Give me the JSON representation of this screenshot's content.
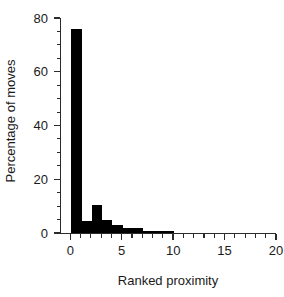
{
  "chart_data": {
    "type": "bar",
    "title": "",
    "subtitle": "",
    "xlabel": "Ranked proximity",
    "ylabel": "Percentage of moves",
    "xlim": [
      -1,
      20
    ],
    "ylim": [
      0,
      80
    ],
    "grid": false,
    "legend": null,
    "bar_color": "#000000",
    "axis_color": "#2b2b2b",
    "bin_width": 1,
    "xticks": [
      0,
      5,
      10,
      15,
      20
    ],
    "xticklabels": [
      "0",
      "5",
      "10",
      "15",
      "20"
    ],
    "xminorticks": [
      1,
      2,
      3,
      4,
      6,
      7,
      8,
      9,
      11,
      12,
      13,
      14,
      16,
      17,
      18,
      19
    ],
    "yticks": [
      0,
      20,
      40,
      60,
      80
    ],
    "yticklabels": [
      "0",
      "20",
      "40",
      "60",
      "80"
    ],
    "yminorticks": [
      5,
      10,
      15,
      25,
      30,
      35,
      45,
      50,
      55,
      65,
      70,
      75
    ],
    "categories": [
      "0",
      "1",
      "2",
      "3",
      "4",
      "5",
      "6",
      "7",
      "8",
      "9",
      "10",
      "11",
      "12",
      "13",
      "14",
      "15",
      "16",
      "17",
      "18",
      "19"
    ],
    "values": [
      76,
      4.5,
      10.5,
      5,
      3,
      2,
      2,
      0.8,
      0.8,
      0.8,
      0,
      0,
      0,
      0,
      0,
      0,
      0,
      0,
      0,
      0
    ],
    "bars": [
      {
        "x0": 0,
        "x1": 1,
        "value": 76
      },
      {
        "x0": 1,
        "x1": 2,
        "value": 4.5
      },
      {
        "x0": 2,
        "x1": 3,
        "value": 10.5
      },
      {
        "x0": 3,
        "x1": 4,
        "value": 5
      },
      {
        "x0": 4,
        "x1": 5,
        "value": 3
      },
      {
        "x0": 5,
        "x1": 6,
        "value": 2
      },
      {
        "x0": 6,
        "x1": 7,
        "value": 2
      },
      {
        "x0": 7,
        "x1": 8,
        "value": 0.8
      },
      {
        "x0": 8,
        "x1": 9,
        "value": 0.8
      },
      {
        "x0": 9,
        "x1": 10,
        "value": 0.8
      }
    ]
  }
}
